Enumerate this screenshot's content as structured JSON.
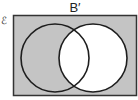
{
  "diagram": {
    "title": "B′",
    "universal_set_symbol": "ℰ",
    "sets": [
      {
        "name": "A",
        "cx": 55,
        "cy": 58,
        "r": 34
      },
      {
        "name": "B",
        "cx": 93,
        "cy": 58,
        "r": 34
      }
    ],
    "shaded_region": "complement of B",
    "colors": {
      "shade": "#c4c4c4",
      "unshaded": "#ffffff",
      "outline": "#1e1e1e"
    }
  }
}
